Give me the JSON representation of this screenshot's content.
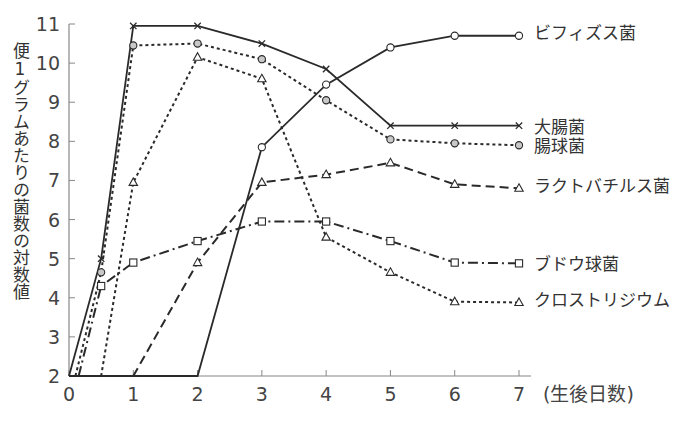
{
  "chart_data": {
    "type": "line",
    "title": "",
    "xlabel": "(生後日数)",
    "ylabel": "便1グラムあたりの菌数の対数値",
    "xlim": [
      0,
      7
    ],
    "ylim": [
      2,
      11
    ],
    "x_ticks": [
      0,
      1,
      2,
      3,
      4,
      5,
      6,
      7
    ],
    "y_ticks": [
      2,
      3,
      4,
      5,
      6,
      7,
      8,
      9,
      10,
      11
    ],
    "grid": false,
    "legend_position": "inline-right",
    "series": [
      {
        "name": "ビフィズス菌",
        "marker": "open-circle",
        "line_style": "solid",
        "points": [
          [
            0,
            2
          ],
          [
            2,
            2
          ],
          [
            3,
            7.85
          ],
          [
            4,
            9.45
          ],
          [
            5,
            10.4
          ],
          [
            6,
            10.7
          ],
          [
            7,
            10.7
          ]
        ]
      },
      {
        "name": "大腸菌",
        "marker": "cross",
        "line_style": "solid",
        "points": [
          [
            0,
            2
          ],
          [
            0.5,
            5.0
          ],
          [
            1,
            10.95
          ],
          [
            2,
            10.95
          ],
          [
            3,
            10.5
          ],
          [
            4,
            9.85
          ],
          [
            5,
            8.4
          ],
          [
            6,
            8.4
          ],
          [
            7,
            8.4
          ]
        ]
      },
      {
        "name": "腸球菌",
        "marker": "gray-circle",
        "line_style": "dotted",
        "points": [
          [
            0.1,
            2
          ],
          [
            0.5,
            4.65
          ],
          [
            1,
            10.45
          ],
          [
            2,
            10.5
          ],
          [
            3,
            10.1
          ],
          [
            4,
            9.05
          ],
          [
            5,
            8.05
          ],
          [
            6,
            7.95
          ],
          [
            7,
            7.9
          ]
        ]
      },
      {
        "name": "ラクトバチルス菌",
        "marker": "open-triangle",
        "line_style": "dashed",
        "points": [
          [
            1,
            2
          ],
          [
            2,
            4.9
          ],
          [
            3,
            6.95
          ],
          [
            4,
            7.15
          ],
          [
            5,
            7.45
          ],
          [
            6,
            6.9
          ],
          [
            7,
            6.8
          ]
        ]
      },
      {
        "name": "ブドウ球菌",
        "marker": "open-square",
        "line_style": "dash-dot",
        "points": [
          [
            0.15,
            2
          ],
          [
            0.5,
            4.3
          ],
          [
            1,
            4.9
          ],
          [
            2,
            5.45
          ],
          [
            3,
            5.95
          ],
          [
            4,
            5.95
          ],
          [
            5,
            5.45
          ],
          [
            6,
            4.9
          ],
          [
            7,
            4.88
          ]
        ]
      },
      {
        "name": "クロストリジウム",
        "marker": "open-triangle",
        "line_style": "dotted",
        "points": [
          [
            0.5,
            2
          ],
          [
            1,
            6.95
          ],
          [
            2,
            10.15
          ],
          [
            3,
            9.6
          ],
          [
            4,
            5.55
          ],
          [
            5,
            4.65
          ],
          [
            6,
            3.9
          ],
          [
            7,
            3.88
          ]
        ]
      }
    ]
  },
  "axis": {
    "ylabel": "便1グラムあたりの菌数の対数値",
    "xlabel": "(生後日数)",
    "xtick_labels": [
      "0",
      "1",
      "2",
      "3",
      "4",
      "5",
      "6",
      "7"
    ],
    "ytick_labels": [
      "2",
      "3",
      "4",
      "5",
      "6",
      "7",
      "8",
      "9",
      "10",
      "11"
    ]
  },
  "legend": {
    "bifidus": "ビフィズス菌",
    "ecoli": "大腸菌",
    "enterococcus": "腸球菌",
    "lactobacillus": "ラクトバチルス菌",
    "staphylococcus": "ブドウ球菌",
    "clostridium": "クロストリジウム"
  },
  "colors": {
    "line": "#2a2a2a",
    "axis": "#888888",
    "gray_marker_fill": "#c8c8c8"
  }
}
